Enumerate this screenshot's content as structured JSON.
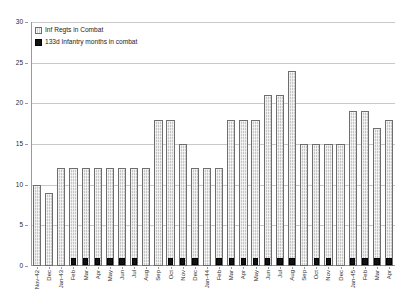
{
  "chart_data": {
    "type": "bar",
    "title": "",
    "xlabel": "",
    "ylabel": "",
    "ylim": [
      0,
      30
    ],
    "ytick_step": 5,
    "yticks": [
      0,
      5,
      10,
      15,
      20,
      25,
      30
    ],
    "grid": true,
    "grid_axis": "y",
    "legend_position": "top-left",
    "categories": [
      "Nov-42",
      "Dec",
      "Jan-43",
      "Feb",
      "Mar",
      "Apr",
      "May",
      "Jun",
      "Jul",
      "Aug",
      "Sep",
      "Oct",
      "Nov",
      "Dec",
      "Jan-44",
      "Feb",
      "Mar",
      "Apr",
      "May",
      "Jun",
      "Jul",
      "Aug",
      "Sep",
      "Oct",
      "Nov",
      "Dec",
      "Jan-45",
      "Feb",
      "Mar",
      "Apr"
    ],
    "series": [
      {
        "name": "Inf Regts in Combat",
        "color": "#c6c6c6",
        "pattern": "hatched",
        "values": [
          10,
          9,
          12,
          12,
          12,
          12,
          12,
          12,
          12,
          12,
          18,
          18,
          15,
          12,
          12,
          12,
          18,
          18,
          18,
          21,
          21,
          24,
          15,
          15,
          15,
          15,
          19,
          19,
          17,
          18
        ]
      },
      {
        "name": "133d Infantry months in combat",
        "color": "#111111",
        "pattern": "solid",
        "values": [
          0,
          0,
          0,
          1,
          1,
          1,
          1,
          1,
          1,
          0,
          0,
          1,
          1,
          1,
          0,
          1,
          1,
          1,
          1,
          1,
          1,
          1,
          0,
          1,
          1,
          0,
          1,
          1,
          1,
          1
        ]
      }
    ]
  },
  "legend": {
    "items": [
      {
        "label": "Inf Regts in Combat",
        "key": "hatch-swatch-icon"
      },
      {
        "label": "133d Infantry months in combat",
        "key": "solid-swatch-icon"
      }
    ]
  }
}
